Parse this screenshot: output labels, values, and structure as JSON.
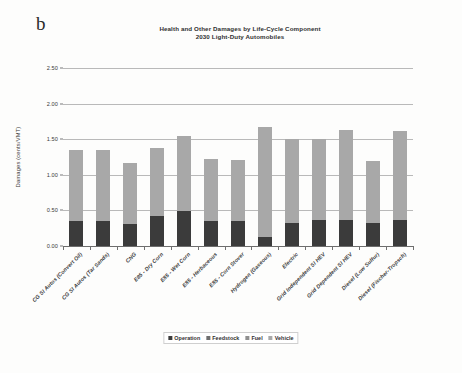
{
  "panel": {
    "letter": "b"
  },
  "chart_data": {
    "type": "bar",
    "stacked": true,
    "title": "Health and Other Damages by Life-Cycle Component",
    "subtitle": "2030 Light-Duty Automobiles",
    "xlabel": "",
    "ylabel": "Damages (cents/VMT)",
    "ylim": [
      0.0,
      2.5
    ],
    "ytick_labels": [
      "0.00",
      "0.50",
      "1.00",
      "1.50",
      "2.00",
      "2.50"
    ],
    "ytick_values": [
      0.0,
      0.5,
      1.0,
      1.5,
      2.0,
      2.5
    ],
    "grid": true,
    "legend_position": "bottom",
    "categories": [
      "CG SI Autos (Convert Oil)",
      "CG SI Autos (Tar Sands)",
      "CNG",
      "E85 - Dry Corn",
      "E85 - Wet Corn",
      "E85 - Herbaceous",
      "E85 - Corn Stover",
      "Hydrogen (Gaseous)",
      "Electric",
      "Grid Independent SI HEV",
      "Grid Dependent SI HEV",
      "Diesel (Low Sulfur)",
      "Diesel (Fischer-Tropsch)"
    ],
    "series": [
      {
        "name": "Operation",
        "color": "#3b3b3b",
        "values": [
          0.35,
          0.35,
          0.31,
          0.42,
          0.49,
          0.35,
          0.35,
          0.12,
          0.32,
          0.36,
          0.37,
          0.32,
          0.37
        ]
      },
      {
        "name": "Feedstock",
        "color": "#6e6e6e",
        "values": [
          0.0,
          0.0,
          0.0,
          0.0,
          0.0,
          0.0,
          0.0,
          0.0,
          0.0,
          0.0,
          0.0,
          0.0,
          0.0
        ]
      },
      {
        "name": "Fuel",
        "color": "#8f8f8f",
        "values": [
          0.0,
          0.0,
          0.0,
          0.0,
          0.0,
          0.0,
          0.0,
          0.0,
          0.0,
          0.0,
          0.0,
          0.0,
          0.0
        ]
      },
      {
        "name": "Vehicle",
        "color": "#a8a8a8",
        "values": [
          1.0,
          1.0,
          0.86,
          0.95,
          1.06,
          0.87,
          0.86,
          1.55,
          1.18,
          1.14,
          1.26,
          0.87,
          1.25
        ]
      }
    ],
    "totals": [
      1.35,
      1.35,
      1.17,
      1.37,
      1.55,
      1.22,
      1.21,
      1.67,
      1.5,
      1.5,
      1.63,
      1.19,
      1.62
    ]
  },
  "legend": {
    "items": [
      {
        "label": "Operation",
        "color": "#3b3b3b"
      },
      {
        "label": "Feedstock",
        "color": "#6e6e6e"
      },
      {
        "label": "Fuel",
        "color": "#8f8f8f"
      },
      {
        "label": "Vehicle",
        "color": "#a8a8a8"
      }
    ]
  }
}
